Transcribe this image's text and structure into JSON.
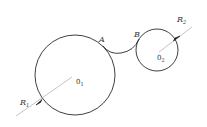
{
  "diagram": {
    "type": "tangent-arc-construction",
    "circles": [
      {
        "id": "O1",
        "center_label": "0",
        "center_sub": "1",
        "radius_label": "R",
        "radius_sub": "1",
        "cx": 75,
        "cy": 75,
        "r": 40
      },
      {
        "id": "O2",
        "center_label": "0",
        "center_sub": "2",
        "radius_label": "R",
        "radius_sub": "2",
        "cx": 157,
        "cy": 50,
        "r": 21
      }
    ],
    "connecting_arc": {
      "start_label": "A",
      "end_label": "B"
    },
    "colors": {
      "stroke": "#2a2a2a",
      "leader": "#9a9a9a",
      "text": "#333333"
    }
  }
}
